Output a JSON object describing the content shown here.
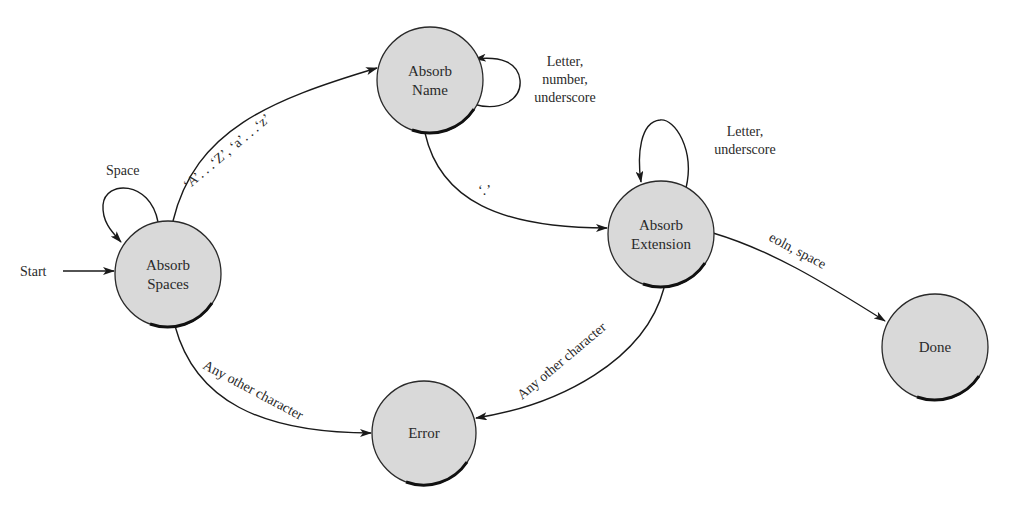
{
  "diagram": {
    "type": "state-machine",
    "start_label": "Start",
    "nodes": [
      {
        "id": "absorb-spaces",
        "lines": [
          "Absorb",
          "Spaces"
        ],
        "cx": 168,
        "cy": 274,
        "r": 53
      },
      {
        "id": "absorb-name",
        "lines": [
          "Absorb",
          "Name"
        ],
        "cx": 430,
        "cy": 80,
        "r": 53
      },
      {
        "id": "absorb-extension",
        "lines": [
          "Absorb",
          "Extension"
        ],
        "cx": 661,
        "cy": 234,
        "r": 53
      },
      {
        "id": "done",
        "lines": [
          "Done"
        ],
        "cx": 935,
        "cy": 347,
        "r": 53
      },
      {
        "id": "error",
        "lines": [
          "Error"
        ],
        "cx": 424,
        "cy": 433,
        "r": 52
      }
    ],
    "edges": [
      {
        "from": "start",
        "to": "absorb-spaces",
        "label": "Start"
      },
      {
        "from": "absorb-spaces",
        "to": "absorb-spaces",
        "label": "Space"
      },
      {
        "from": "absorb-spaces",
        "to": "absorb-name",
        "label": "‘A’. . .‘Z’, ‘a’. . .‘z’"
      },
      {
        "from": "absorb-name",
        "to": "absorb-name",
        "label_lines": [
          "Letter,",
          "number,",
          "underscore"
        ]
      },
      {
        "from": "absorb-name",
        "to": "absorb-extension",
        "label": "‘.’"
      },
      {
        "from": "absorb-extension",
        "to": "absorb-extension",
        "label_lines": [
          "Letter,",
          "underscore"
        ]
      },
      {
        "from": "absorb-extension",
        "to": "done",
        "label": "eoln, space"
      },
      {
        "from": "absorb-spaces",
        "to": "error",
        "label": "Any other character"
      },
      {
        "from": "absorb-extension",
        "to": "error",
        "label": "Any other character"
      }
    ]
  },
  "labels": {
    "start": "Start",
    "space_loop": "Space",
    "az_edge": "‘A’. . .‘Z’, ‘a’. . .‘z’",
    "name_loop_1": "Letter,",
    "name_loop_2": "number,",
    "name_loop_3": "underscore",
    "dot_edge": "‘.’",
    "ext_loop_1": "Letter,",
    "ext_loop_2": "underscore",
    "done_edge": "eoln, space",
    "error_edge_left": "Any other character",
    "error_edge_right": "Any other character",
    "spaces_1": "Absorb",
    "spaces_2": "Spaces",
    "name_1": "Absorb",
    "name_2": "Name",
    "ext_1": "Absorb",
    "ext_2": "Extension",
    "done": "Done",
    "error": "Error"
  },
  "colors": {
    "node_fill": "#d9d9d9",
    "stroke": "#1a1a1a",
    "background": "#ffffff"
  }
}
